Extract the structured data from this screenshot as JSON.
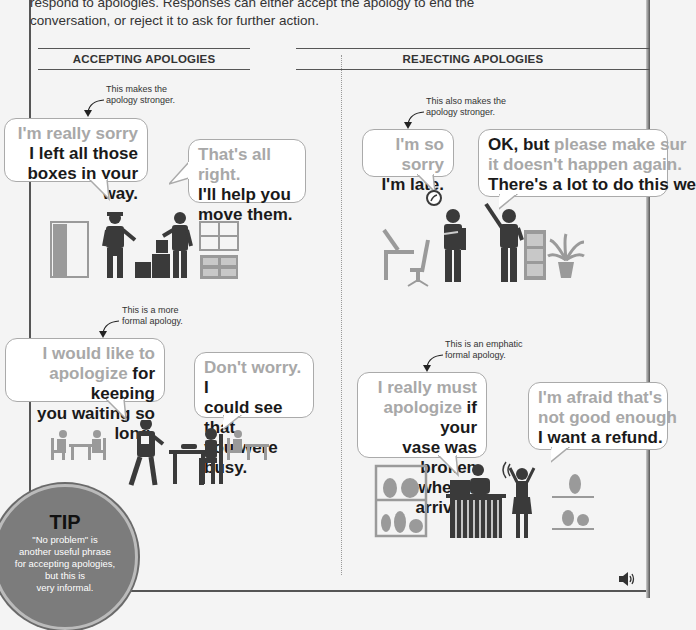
{
  "intro": {
    "text_line1": "respond to apologies. Responses can either accept the apology to end the",
    "text_line2": "conversation, or reject it to ask for further action."
  },
  "sections": {
    "accepting": {
      "title": "ACCEPTING APOLOGIES",
      "examples": [
        {
          "note_line1": "This makes the",
          "note_line2": "apology stronger.",
          "apology": {
            "gray": "I'm really sorry",
            "black": "I left all those boxes in your way.",
            "black_line1": "I left all those",
            "black_line2": "boxes in your way."
          },
          "response": {
            "gray": "That's all right.",
            "black_line1": "I'll help you",
            "black_line2": "move them."
          },
          "scene": "delivery-man-boxes-office"
        },
        {
          "note_line1": "This is a more",
          "note_line2": "formal apology.",
          "apology": {
            "gray_line1": "I would like to",
            "gray_line2": "apologize",
            "black_line2": " for keeping",
            "black_line3": "you waiting so long."
          },
          "response": {
            "gray": "Don't worry.",
            "black_line1": " I",
            "black_line2": "could see that",
            "black_line3": "you were busy."
          },
          "scene": "restaurant-waiter"
        }
      ]
    },
    "rejecting": {
      "title": "REJECTING APOLOGIES",
      "examples": [
        {
          "note_line1": "This also makes the",
          "note_line2": "apology stronger.",
          "apology": {
            "gray": "I'm so sorry",
            "black": "I'm late."
          },
          "response": {
            "black1": "OK, but",
            "gray1": " please make sur",
            "gray2": "it doesn't happen again.",
            "black3": "There's a lot to do this we"
          },
          "scene": "office-clock-late"
        },
        {
          "note_line1": "This is an emphatic",
          "note_line2": "formal apology.",
          "apology": {
            "gray_line1": "I really must",
            "gray_line2": "apologize",
            "black_line2": " if your",
            "black_line3": "vase was broken",
            "black_line4": "when it arrived."
          },
          "response": {
            "gray_line1": "I'm afraid that's",
            "gray_line2": "not good enough",
            "black_line3": "I want a refund."
          },
          "scene": "vase-shop-complaint"
        }
      ]
    }
  },
  "tip": {
    "title": "TIP",
    "line1": "\"No problem\" is",
    "line2": "another useful phrase",
    "line3": "for accepting apologies,",
    "line4": "but this is",
    "line5": "very informal."
  },
  "audio": {
    "icon": "speaker-icon"
  },
  "colors": {
    "dark_figure": "#3a3a3a",
    "light_figure": "#9a9a9a",
    "gray_text": "#a8a8a8",
    "tip_circle": "#7c7c7c"
  }
}
